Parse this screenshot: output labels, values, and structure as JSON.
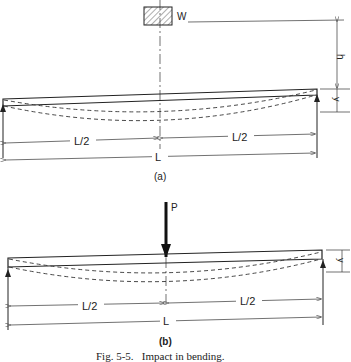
{
  "figure": {
    "caption": "Fig. 5-5.   Impact in bending.",
    "panel_a": {
      "label": "(a)",
      "weight_label": "W",
      "height_label": "h",
      "deflection_label": "y",
      "half_span_left": "L/2",
      "half_span_right": "L/2",
      "span": "L"
    },
    "panel_b": {
      "label": "(b)",
      "load_label": "P",
      "deflection_label": "y",
      "half_span_left": "L/2",
      "half_span_right": "L/2",
      "span": "L"
    }
  }
}
